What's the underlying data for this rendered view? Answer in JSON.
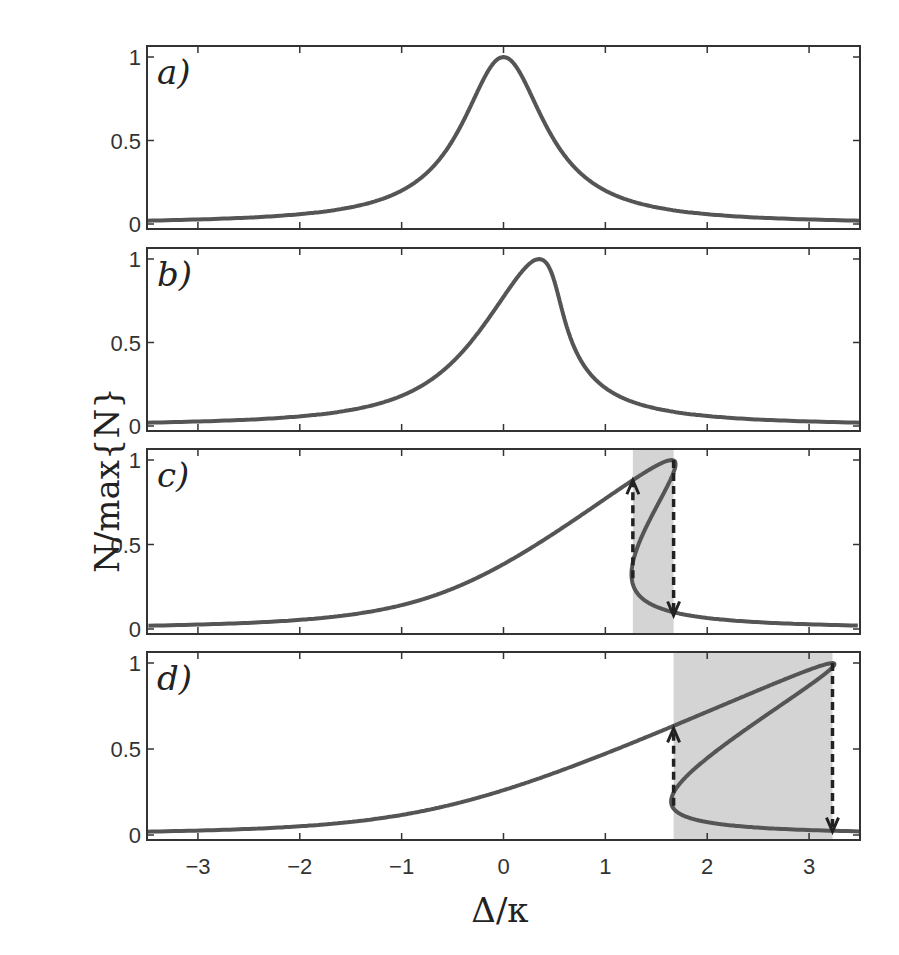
{
  "chart_data": {
    "type": "line",
    "title": "",
    "xlabel": "Δ/κ",
    "ylabel": "N/max{N}",
    "xlim": [
      -3.5,
      3.5
    ],
    "ylim": [
      0,
      1
    ],
    "x_ticks": [
      -3,
      -2,
      -1,
      0,
      1,
      2,
      3
    ],
    "x_tick_labels": [
      "−3",
      "−2",
      "−1",
      "0",
      "1",
      "2",
      "3"
    ],
    "y_ticks": [
      0,
      0.5,
      1
    ],
    "y_tick_labels": [
      "0",
      "0.5",
      "1"
    ],
    "grid": false,
    "line_color": "#555555",
    "shade_color": "#d4d4d4",
    "panels": [
      {
        "label": "a)",
        "peak_position": 0.0,
        "half_width": 0.5,
        "shaded": null,
        "arrows": [],
        "sample_points": [
          [
            -3.5,
            0.02
          ],
          [
            -2,
            0.06
          ],
          [
            -1,
            0.2
          ],
          [
            -0.5,
            0.5
          ],
          [
            0,
            1.0
          ],
          [
            0.5,
            0.5
          ],
          [
            1,
            0.2
          ],
          [
            2,
            0.06
          ],
          [
            3.5,
            0.02
          ]
        ]
      },
      {
        "label": "b)",
        "peak_position": 0.35,
        "half_width": 0.5,
        "shaded": null,
        "arrows": [],
        "sample_points": [
          [
            -3.5,
            0.02
          ],
          [
            -2,
            0.06
          ],
          [
            -1,
            0.19
          ],
          [
            0,
            0.62
          ],
          [
            0.35,
            1.0
          ],
          [
            0.7,
            0.5
          ],
          [
            1,
            0.28
          ],
          [
            2,
            0.07
          ],
          [
            3.5,
            0.02
          ]
        ]
      },
      {
        "label": "c)",
        "peak_position": 1.65,
        "half_width": 0.5,
        "shaded": [
          1.27,
          1.67
        ],
        "arrows": [
          {
            "x": 1.27,
            "from": 0.3,
            "to": 0.88,
            "direction": "up"
          },
          {
            "x": 1.67,
            "from": 1.0,
            "to": 0.08,
            "direction": "down"
          }
        ],
        "sample_points": [
          [
            -3.5,
            0.02
          ],
          [
            -2,
            0.05
          ],
          [
            -1,
            0.14
          ],
          [
            0,
            0.37
          ],
          [
            1,
            0.76
          ],
          [
            1.27,
            0.88
          ],
          [
            1.65,
            1.0
          ],
          [
            1.27,
            0.3
          ],
          [
            1.67,
            0.08
          ],
          [
            2.5,
            0.03
          ],
          [
            3.5,
            0.01
          ]
        ]
      },
      {
        "label": "d)",
        "peak_position": 3.23,
        "half_width": 0.5,
        "shaded": [
          1.67,
          3.23
        ],
        "arrows": [
          {
            "x": 1.67,
            "from": 0.17,
            "to": 0.62,
            "direction": "up"
          },
          {
            "x": 3.23,
            "from": 1.0,
            "to": 0.02,
            "direction": "down"
          }
        ],
        "sample_points": [
          [
            -3.5,
            0.02
          ],
          [
            -2,
            0.05
          ],
          [
            -1,
            0.12
          ],
          [
            0,
            0.27
          ],
          [
            1,
            0.48
          ],
          [
            1.67,
            0.62
          ],
          [
            3.23,
            1.0
          ],
          [
            2.2,
            0.45
          ],
          [
            1.67,
            0.17
          ],
          [
            2.5,
            0.05
          ],
          [
            3.5,
            0.01
          ]
        ]
      }
    ]
  }
}
